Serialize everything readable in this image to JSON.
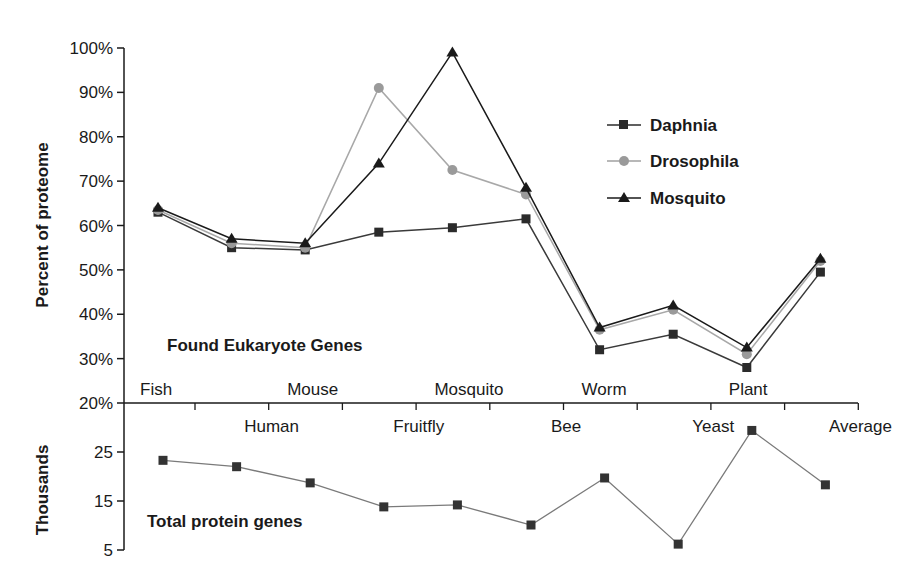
{
  "chart_data": [
    {
      "type": "line",
      "title": "",
      "annotation": "Found Eukaryote Genes",
      "xlabel": "",
      "ylabel": "Percent of proteome",
      "ylim": [
        20,
        100
      ],
      "yticks": [
        "20%",
        "30%",
        "40%",
        "50%",
        "60%",
        "70%",
        "80%",
        "90%",
        "100%"
      ],
      "grid": false,
      "legend_position": "upper right (inside)",
      "categories": [
        "Fish",
        "Human",
        "Mouse",
        "Fruitfly",
        "Mosquito",
        "Bee",
        "Worm",
        "Yeast",
        "Plant",
        "Average"
      ],
      "series": [
        {
          "name": "Daphnia",
          "marker": "square",
          "color": "#2b2b2b",
          "values": [
            63,
            55,
            54.5,
            58.5,
            59.5,
            61.5,
            32,
            35.5,
            28,
            49.5
          ]
        },
        {
          "name": "Drosophila",
          "marker": "circle",
          "color": "#9a9a9a",
          "values": [
            63.5,
            56,
            55,
            91,
            72.5,
            67,
            36.5,
            41,
            31,
            52
          ]
        },
        {
          "name": "Mosquito",
          "marker": "triangle",
          "color": "#1a1a1a",
          "values": [
            64,
            57,
            56,
            74,
            99,
            68.5,
            37,
            42,
            32.5,
            52.5
          ]
        }
      ]
    },
    {
      "type": "line",
      "title": "",
      "annotation": "Total protein genes",
      "xlabel": "",
      "ylabel": "Thousands",
      "ylim": [
        5,
        30
      ],
      "yticks": [
        "5",
        "15",
        "25"
      ],
      "grid": false,
      "categories": [
        "Fish",
        "Human",
        "Mouse",
        "Fruitfly",
        "Mosquito",
        "Bee",
        "Worm",
        "Yeast",
        "Plant",
        "Average"
      ],
      "series": [
        {
          "name": "Total protein genes",
          "marker": "square",
          "color": "#2b2b2b",
          "values": [
            23.3,
            22,
            18.7,
            13.8,
            14.2,
            10.1,
            19.7,
            6.2,
            29.4,
            18.3
          ]
        }
      ]
    }
  ],
  "labels": {
    "top_ylabel": "Percent of proteome",
    "bottom_ylabel": "Thousands",
    "top_annotation": "Found Eukaryote Genes",
    "bottom_annotation": "Total protein genes",
    "upper_row_categories": [
      "Fish",
      "Mouse",
      "Mosquito",
      "Worm",
      "Plant"
    ],
    "lower_row_categories": [
      "Human",
      "Fruitfly",
      "Bee",
      "Yeast",
      "Average"
    ]
  },
  "legend": [
    {
      "label": "Daphnia",
      "marker": "square"
    },
    {
      "label": "Drosophila",
      "marker": "circle"
    },
    {
      "label": "Mosquito",
      "marker": "triangle"
    }
  ]
}
